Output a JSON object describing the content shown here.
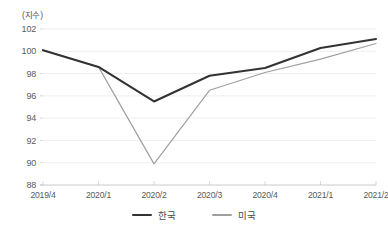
{
  "chart_data": {
    "type": "line",
    "title": "",
    "xlabel": "",
    "ylabel": "(지수)",
    "unit_label": "(지수)",
    "categories": [
      "2019/4",
      "2020/1",
      "2020/2",
      "2020/3",
      "2020/4",
      "2021/1",
      "2021/2"
    ],
    "series": [
      {
        "name": "한국",
        "color": "#333333",
        "line_width": 2.1,
        "values": [
          100.1,
          98.6,
          95.5,
          97.8,
          98.5,
          100.3,
          101.1
        ]
      },
      {
        "name": "미국",
        "color": "#a0a0a0",
        "line_width": 1.2,
        "values": [
          100.1,
          98.6,
          89.9,
          96.5,
          98.1,
          99.3,
          100.7
        ]
      }
    ],
    "ylim": [
      88,
      102
    ],
    "yticks": [
      88,
      90,
      92,
      94,
      96,
      98,
      100,
      102
    ],
    "ytick_labels": [
      "88",
      "90",
      "92",
      "94",
      "96",
      "98",
      "100",
      "102"
    ],
    "grid": true,
    "grid_axis": "y",
    "grid_color": "#e6e6e6",
    "legend_position": "bottom"
  },
  "legend": {
    "entries": [
      {
        "label": "한국",
        "color": "#333333"
      },
      {
        "label": "미국",
        "color": "#a0a0a0"
      }
    ]
  }
}
